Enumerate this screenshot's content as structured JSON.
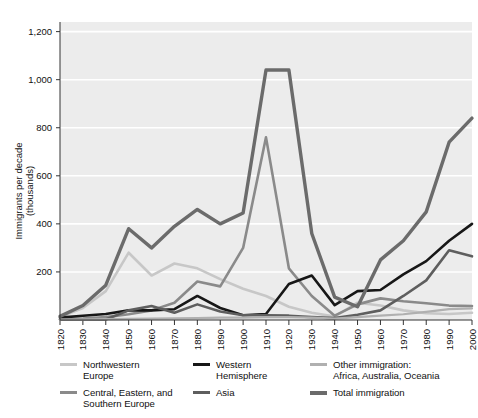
{
  "chart_data": {
    "type": "line",
    "title": "",
    "xlabel": "",
    "ylabel": "Immigrants per decade\n(thousands)",
    "x": [
      1820,
      1830,
      1840,
      1850,
      1860,
      1870,
      1880,
      1890,
      1900,
      1910,
      1920,
      1930,
      1940,
      1950,
      1960,
      1970,
      1980,
      1990,
      2000
    ],
    "xtick_labels": [
      "1820",
      "1830",
      "1840",
      "1850",
      "1860",
      "1870",
      "1880",
      "1890",
      "1900",
      "1910",
      "1920",
      "1930",
      "1940",
      "1950",
      "1960",
      "1970",
      "1980",
      "1990",
      "2000"
    ],
    "ytick_labels": [
      "200",
      "400",
      "600",
      "800",
      "1,000",
      "1,200"
    ],
    "yticks": [
      200,
      400,
      600,
      800,
      1000,
      1200
    ],
    "ylim": [
      0,
      1240
    ],
    "xlim": [
      1820,
      2000
    ],
    "grid": "horizontal-white",
    "legend_position": "below",
    "series": [
      {
        "name": "Northwestern Europe",
        "color": "#c7c7c7",
        "width": 2.6,
        "values": [
          12,
          50,
          120,
          280,
          185,
          235,
          215,
          170,
          130,
          100,
          55,
          30,
          14,
          72,
          60,
          40,
          28,
          25,
          30
        ]
      },
      {
        "name": "Central, Eastern, and Southern Europe",
        "color": "#8a8a8a",
        "width": 2.6,
        "values": [
          3,
          6,
          12,
          24,
          40,
          72,
          160,
          140,
          300,
          760,
          215,
          100,
          18,
          65,
          90,
          78,
          70,
          60,
          58
        ]
      },
      {
        "name": "Western Hemisphere",
        "color": "#171717",
        "width": 2.6,
        "values": [
          10,
          18,
          25,
          40,
          40,
          45,
          100,
          50,
          20,
          25,
          150,
          185,
          62,
          120,
          125,
          190,
          245,
          330,
          400
        ]
      },
      {
        "name": "Asia",
        "color": "#5e5e5e",
        "width": 2.6,
        "values": [
          2,
          2,
          2,
          40,
          58,
          30,
          65,
          35,
          20,
          20,
          18,
          12,
          8,
          22,
          40,
          100,
          165,
          290,
          265
        ]
      },
      {
        "name": "Other immigration: Africa, Australia, Oceania",
        "color": "#b0b0b0",
        "width": 2.2,
        "values": [
          2,
          3,
          4,
          5,
          6,
          7,
          8,
          10,
          10,
          12,
          12,
          10,
          6,
          12,
          18,
          24,
          34,
          45,
          48
        ]
      },
      {
        "name": "Total immigration",
        "color": "#6b6b6b",
        "width": 3.4,
        "values": [
          15,
          60,
          145,
          380,
          300,
          390,
          460,
          400,
          445,
          1040,
          1040,
          360,
          95,
          55,
          250,
          330,
          450,
          740,
          840
        ]
      }
    ],
    "legend": [
      {
        "label": "Northwestern\nEurope",
        "color": "#c7c7c7",
        "thick": false
      },
      {
        "label": "Western\nHemisphere",
        "color": "#171717",
        "thick": false
      },
      {
        "label": "Other immigration:\nAfrica, Australia, Oceania",
        "color": "#b0b0b0",
        "thick": false
      },
      {
        "label": "Central, Eastern, and\nSouthern Europe",
        "color": "#8a8a8a",
        "thick": false
      },
      {
        "label": "Asia",
        "color": "#5e5e5e",
        "thick": false
      },
      {
        "label": "Total immigration",
        "color": "#6b6b6b",
        "thick": true
      }
    ],
    "colors": {
      "plot_background": "#ececec",
      "gridline": "#ffffff",
      "axis": "#333333",
      "text": "#111111"
    }
  }
}
